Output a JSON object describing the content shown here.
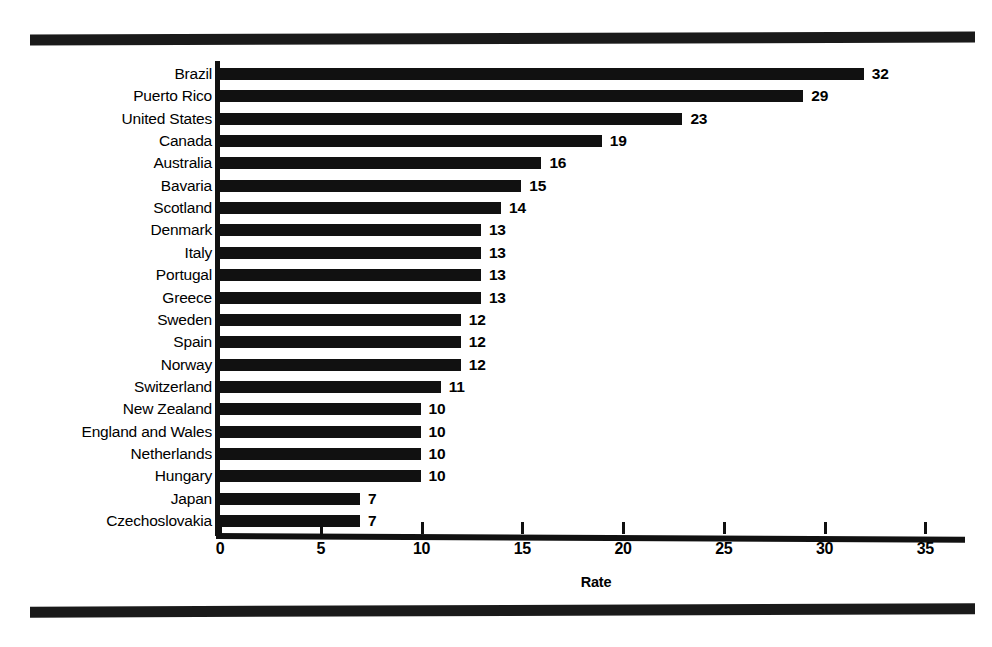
{
  "chart_data": {
    "type": "bar",
    "orientation": "horizontal",
    "title": "",
    "xlabel": "Rate",
    "ylabel": "",
    "xlim": [
      0,
      37
    ],
    "xticks": [
      0,
      5,
      10,
      15,
      20,
      25,
      30,
      35
    ],
    "grid": false,
    "legend": null,
    "bar_color": "#111111",
    "background_color": "#ffffff",
    "show_value_labels": true,
    "categories": [
      "Brazil",
      "Puerto Rico",
      "United States",
      "Canada",
      "Australia",
      "Bavaria",
      "Scotland",
      "Denmark",
      "Italy",
      "Portugal",
      "Greece",
      "Sweden",
      "Spain",
      "Norway",
      "Switzerland",
      "New Zealand",
      "England and Wales",
      "Netherlands",
      "Hungary",
      "Japan",
      "Czechoslovakia"
    ],
    "values": [
      32,
      29,
      23,
      19,
      16,
      15,
      14,
      13,
      13,
      13,
      13,
      12,
      12,
      12,
      11,
      10,
      10,
      10,
      10,
      7,
      7
    ]
  },
  "decorations": {
    "top_rule": "horizontal-rule",
    "bottom_rule": "horizontal-rule"
  }
}
